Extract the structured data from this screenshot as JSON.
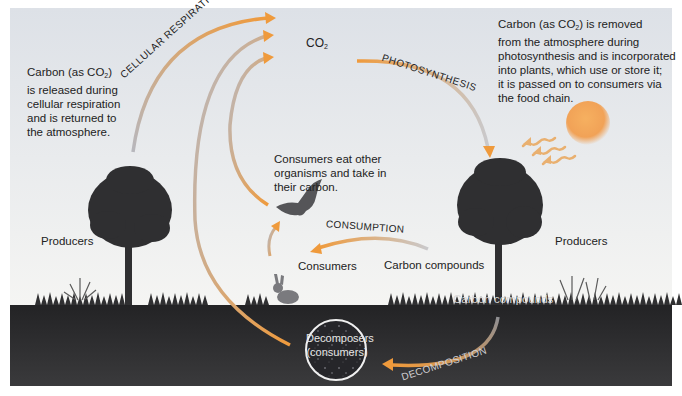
{
  "diagram": {
    "colors": {
      "sky_top": "#dfe3e8",
      "sky_bottom": "#f4f4f2",
      "soil": "#2e2e30",
      "arrow_start": "#a9a9b0",
      "arrow_end": "#ee9a3a",
      "sun": "#f0a050",
      "tree": "#2f2f31"
    },
    "notes": {
      "respiration": {
        "line1": "Carbon (as CO",
        "sub": "2",
        "rest1": ")",
        "line2": "is released during",
        "line3": "cellular respiration",
        "line4": "and is returned to",
        "line5": "the atmosphere."
      },
      "photosynthesis": {
        "line1": "Carbon (as CO",
        "sub": "2",
        "rest1": ") is removed",
        "line2": "from the atmosphere during",
        "line3": "photosynthesis and is incorporated",
        "line4": "into plants, which use or store it;",
        "line5": "it is passed on to consumers via",
        "line6": "the food chain."
      },
      "consumers": {
        "line1": "Consumers eat other",
        "line2": "organisms and take in",
        "line3": "their carbon."
      }
    },
    "labels": {
      "co2_main": "CO",
      "co2_sub": "2",
      "cellular_respiration": "CELLULAR RESPIRATION",
      "photosynthesis": "PHOTOSYNTHESIS",
      "consumption": "CONSUMPTION",
      "decomposition": "DECOMPOSITION",
      "producers_left": "Producers",
      "producers_right": "Producers",
      "consumers": "Consumers",
      "carbon_compounds_surface": "Carbon compounds",
      "carbon_compounds_soil": "Carbon compounds",
      "decomposers_line1": "Decomposers",
      "decomposers_line2": "(consumers)"
    }
  }
}
